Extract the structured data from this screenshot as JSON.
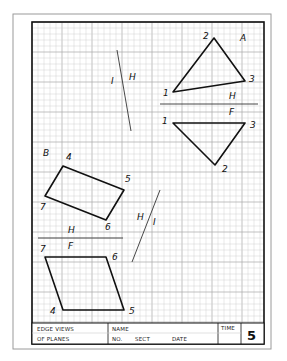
{
  "sheet": {
    "outer_border": {
      "x": 13,
      "y": 14,
      "w": 258,
      "h": 335,
      "color": "#9a9a9a"
    },
    "frame": {
      "x": 32,
      "y": 22,
      "w": 232,
      "h": 322,
      "color": "#111111"
    },
    "grid": {
      "spacing": 6,
      "major_every": 5,
      "minor_color": "#d2d2d2",
      "major_color": "#a8a8a8"
    }
  },
  "problem_a": {
    "label": "A",
    "top_view": {
      "points": [
        {
          "id": "1",
          "x": 173,
          "y": 92
        },
        {
          "id": "2",
          "x": 214,
          "y": 38
        },
        {
          "id": "3",
          "x": 245,
          "y": 81
        }
      ]
    },
    "front_view": {
      "points": [
        {
          "id": "1",
          "x": 173,
          "y": 123
        },
        {
          "id": "2",
          "x": 215,
          "y": 165
        },
        {
          "id": "3",
          "x": 245,
          "y": 123
        }
      ]
    },
    "fold_line": {
      "x1": 160,
      "y1": 104,
      "x2": 258,
      "y2": 104,
      "upper": "H",
      "lower": "F"
    },
    "aux_fold_line": {
      "x1": 117,
      "y1": 50,
      "x2": 131,
      "y2": 131,
      "left": "I",
      "right": "H"
    }
  },
  "problem_b": {
    "label": "B",
    "top_view": {
      "points": [
        {
          "id": "4",
          "x": 63,
          "y": 166
        },
        {
          "id": "5",
          "x": 124,
          "y": 190
        },
        {
          "id": "6",
          "x": 106,
          "y": 220
        },
        {
          "id": "7",
          "x": 45,
          "y": 196
        }
      ]
    },
    "front_view": {
      "points": [
        {
          "id": "7",
          "x": 45,
          "y": 257
        },
        {
          "id": "6",
          "x": 106,
          "y": 257
        },
        {
          "id": "5",
          "x": 124,
          "y": 310
        },
        {
          "id": "4",
          "x": 63,
          "y": 310
        }
      ]
    },
    "fold_line": {
      "x1": 38,
      "y1": 238,
      "x2": 123,
      "y2": 238,
      "upper": "H",
      "lower": "F"
    },
    "aux_fold_line": {
      "x1": 160,
      "y1": 190,
      "x2": 132,
      "y2": 262,
      "left": "H",
      "right": "I"
    }
  },
  "title_block": {
    "title_line1": "EDGE VIEWS",
    "title_line2": "OF PLANES",
    "name_label": "NAME",
    "no_label": "NO.",
    "sect_label": "SECT",
    "date_label": "DATE",
    "time_label": "TIME",
    "sheet_number": "5"
  }
}
